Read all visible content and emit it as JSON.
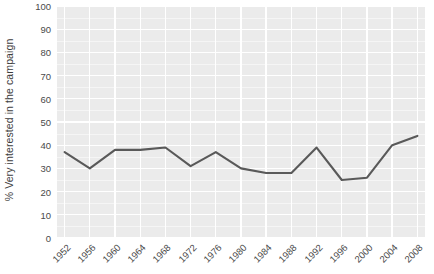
{
  "chart_data": {
    "type": "line",
    "title": "",
    "subtitle": "",
    "xlabel": "",
    "ylabel": "% Very interested in the campaign",
    "categories": [
      "1952",
      "1956",
      "1960",
      "1964",
      "1968",
      "1972",
      "1976",
      "1980",
      "1984",
      "1988",
      "1992",
      "1996",
      "2000",
      "2004",
      "2008"
    ],
    "values": [
      37,
      30,
      38,
      38,
      39,
      31,
      37,
      30,
      28,
      28,
      39,
      25,
      26,
      40,
      44
    ],
    "series": [
      {
        "name": "% Very interested in the campaign",
        "values": [
          37,
          30,
          38,
          38,
          39,
          31,
          37,
          30,
          28,
          28,
          39,
          25,
          26,
          40,
          44
        ]
      }
    ],
    "ylim": [
      0,
      100
    ],
    "y_ticks": [
      0,
      10,
      20,
      30,
      40,
      50,
      60,
      70,
      80,
      90,
      100
    ],
    "y_tick_labels": [
      "0",
      "10",
      "20",
      "30",
      "40",
      "50",
      "60",
      "70",
      "80",
      "90",
      "100"
    ],
    "x_tick_labels": [
      "1952",
      "1956",
      "1960",
      "1964",
      "1968",
      "1972",
      "1976",
      "1980",
      "1984",
      "1988",
      "1992",
      "1996",
      "2000",
      "2004",
      "2008"
    ],
    "grid": true,
    "legend": false,
    "legend_position": "none",
    "annotations": [],
    "colors": {
      "line": "#595959",
      "panel_background": "#ebebeb",
      "gridline_major": "#ffffff",
      "gridline_minor": "#f5f5f5",
      "text": "#4a4a4a",
      "page_background": "#ffffff"
    }
  }
}
